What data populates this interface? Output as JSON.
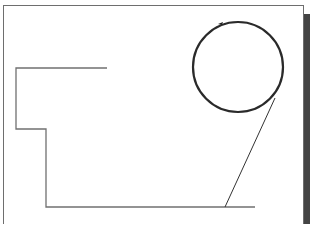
{
  "diagram": {
    "colors": {
      "background": "#ffffff",
      "frame": "#6e6e6e",
      "shadow": "#444444",
      "path": "#707070",
      "circle": "#2a2a2a",
      "diagonal": "#333333"
    },
    "elements": [
      "frame",
      "stepped-path",
      "circle",
      "tangent-line"
    ]
  }
}
